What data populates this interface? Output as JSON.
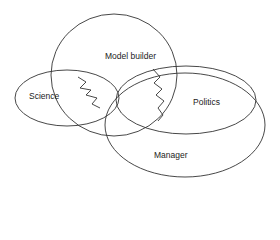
{
  "diagram": {
    "type": "venn-like overlapping ellipses",
    "stroke_color": "#333333",
    "background": "#ffffff",
    "ellipses": [
      {
        "id": "model-builder",
        "label": "Model builder"
      },
      {
        "id": "science",
        "label": "Science"
      },
      {
        "id": "politics",
        "label": "Politics"
      },
      {
        "id": "manager",
        "label": "Manager"
      }
    ]
  }
}
